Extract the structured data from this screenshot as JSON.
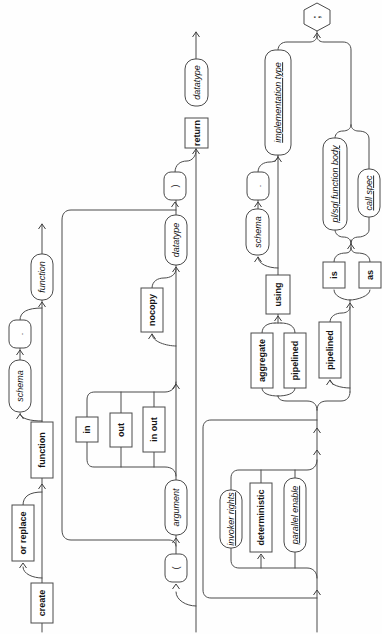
{
  "diagram": {
    "kind_legend": {
      "keyword": "terminal keyword box",
      "nonterminal": "italic placeholder capsule",
      "link": "underlined italic clause link capsule",
      "punct": "punctuation capsule",
      "end": "statement terminator hexagon"
    },
    "colors": {
      "line": "#4a4a4a",
      "text": "#141414",
      "background": "#ffffff"
    },
    "nodes": [
      {
        "id": "create",
        "label": "create",
        "kind": "keyword"
      },
      {
        "id": "or-replace",
        "label": "or replace",
        "kind": "keyword"
      },
      {
        "id": "function-keyword",
        "label": "function",
        "kind": "keyword"
      },
      {
        "id": "schema-1",
        "label": "schema",
        "kind": "nonterminal"
      },
      {
        "id": "dot-1",
        "label": ".",
        "kind": "punct"
      },
      {
        "id": "function-name",
        "label": "function",
        "kind": "nonterminal"
      },
      {
        "id": "open-paren",
        "label": "(",
        "kind": "punct"
      },
      {
        "id": "argument",
        "label": "argument",
        "kind": "nonterminal"
      },
      {
        "id": "in",
        "label": "in",
        "kind": "keyword"
      },
      {
        "id": "out",
        "label": "out",
        "kind": "keyword"
      },
      {
        "id": "in-out",
        "label": "in out",
        "kind": "keyword"
      },
      {
        "id": "nocopy",
        "label": "nocopy",
        "kind": "keyword"
      },
      {
        "id": "datatype-argument",
        "label": "datatype",
        "kind": "nonterminal"
      },
      {
        "id": "close-paren",
        "label": ")",
        "kind": "punct"
      },
      {
        "id": "return",
        "label": "return",
        "kind": "keyword"
      },
      {
        "id": "datatype-return",
        "label": "datatype",
        "kind": "nonterminal"
      },
      {
        "id": "invoker-rights",
        "label": "invoker rights",
        "kind": "link"
      },
      {
        "id": "deterministic",
        "label": "deterministic",
        "kind": "keyword"
      },
      {
        "id": "parallel-enable",
        "label": "parallel enable",
        "kind": "link"
      },
      {
        "id": "aggregate",
        "label": "aggregate",
        "kind": "keyword"
      },
      {
        "id": "pipelined-using",
        "label": "pipelined",
        "kind": "keyword"
      },
      {
        "id": "using",
        "label": "using",
        "kind": "keyword"
      },
      {
        "id": "schema-2",
        "label": "schema",
        "kind": "nonterminal"
      },
      {
        "id": "dot-2",
        "label": ".",
        "kind": "punct"
      },
      {
        "id": "implementation-type",
        "label": "implementation type",
        "kind": "link"
      },
      {
        "id": "pipelined-is",
        "label": "pipelined",
        "kind": "keyword"
      },
      {
        "id": "is",
        "label": "is",
        "kind": "keyword"
      },
      {
        "id": "as",
        "label": "as",
        "kind": "keyword"
      },
      {
        "id": "plsql-function-body",
        "label": "pl/sql function body",
        "kind": "link"
      },
      {
        "id": "call-spec",
        "label": "call spec",
        "kind": "link"
      },
      {
        "id": "semicolon",
        "label": ";",
        "kind": "end"
      }
    ]
  }
}
